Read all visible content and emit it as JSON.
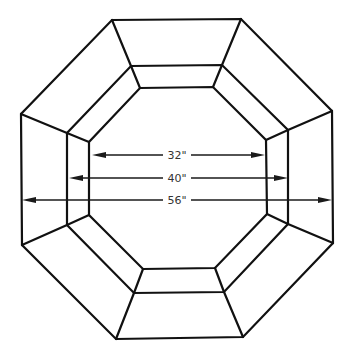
{
  "diagram": {
    "line_color": "#111111",
    "background": "#ffffff",
    "rings": {
      "outer": [
        [
          112,
          20
        ],
        [
          241,
          19
        ],
        [
          332,
          111
        ],
        [
          333,
          243
        ],
        [
          243,
          337
        ],
        [
          116,
          339
        ],
        [
          22,
          245
        ],
        [
          21,
          114
        ]
      ],
      "middle": [
        [
          131,
          66
        ],
        [
          222,
          65
        ],
        [
          288,
          130
        ],
        [
          288,
          224
        ],
        [
          224,
          292
        ],
        [
          134,
          293
        ],
        [
          67,
          225
        ],
        [
          67,
          133
        ]
      ],
      "inner": [
        [
          140,
          88
        ],
        [
          213,
          87
        ],
        [
          266,
          140
        ],
        [
          267,
          214
        ],
        [
          215,
          268
        ],
        [
          143,
          269
        ],
        [
          89,
          215
        ],
        [
          89,
          142
        ]
      ]
    },
    "dimensions": [
      {
        "label": "32\"",
        "x1": 92,
        "x2": 265,
        "y": 155
      },
      {
        "label": "40\"",
        "x1": 69,
        "x2": 288,
        "y": 178
      },
      {
        "label": "56\"",
        "x1": 22,
        "x2": 332,
        "y": 200
      }
    ]
  }
}
